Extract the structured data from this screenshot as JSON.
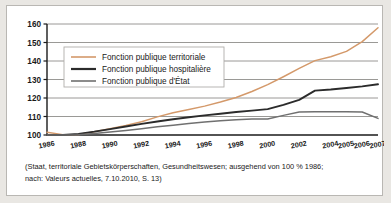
{
  "chart_data": {
    "type": "line",
    "title": "",
    "xlabel": "",
    "ylabel": "",
    "ylim": [
      100,
      160
    ],
    "yticks": [
      100,
      110,
      120,
      130,
      140,
      150,
      160
    ],
    "grid": true,
    "legend_position": "upper-left-inside",
    "x": [
      1986,
      1987,
      1988,
      1989,
      1990,
      1991,
      1992,
      1993,
      1994,
      1995,
      1996,
      1997,
      1998,
      1999,
      2000,
      2001,
      2002,
      2003,
      2004,
      2005,
      2006,
      2007
    ],
    "xticks": [
      1986,
      1988,
      1990,
      1992,
      1994,
      1996,
      1998,
      2000,
      2002,
      2004,
      2005,
      2006,
      2007
    ],
    "xtick_labels": [
      "1986",
      "1988",
      "1990",
      "1992",
      "1994",
      "1996",
      "1998",
      "2000",
      "2002",
      "2004",
      "2005",
      "2006",
      "2007"
    ],
    "series": [
      {
        "name": "Fonction publique territoriale",
        "color": "#d4996a",
        "values": [
          101.5,
          100.2,
          100.3,
          101.8,
          103.4,
          105.2,
          107.2,
          109.8,
          112.0,
          113.8,
          115.6,
          117.8,
          120.3,
          123.5,
          127.2,
          131.5,
          136.0,
          140.2,
          142.3,
          145.2,
          150.5,
          158.0
        ]
      },
      {
        "name": "Fonction publique hospitalière",
        "color": "#2b2b2b",
        "values": [
          100.0,
          100.0,
          100.6,
          101.8,
          103.2,
          104.6,
          106.0,
          107.3,
          108.5,
          109.6,
          110.6,
          111.5,
          112.4,
          113.2,
          114.0,
          116.3,
          119.0,
          124.0,
          124.6,
          125.4,
          126.3,
          127.4
        ]
      },
      {
        "name": "Fonction publique d'État",
        "color": "#707070",
        "values": [
          100.0,
          100.0,
          100.2,
          100.8,
          101.6,
          102.5,
          103.4,
          104.4,
          105.3,
          106.2,
          107.0,
          107.7,
          108.3,
          108.6,
          108.6,
          110.6,
          112.4,
          112.6,
          112.6,
          112.6,
          112.4,
          109.0
        ]
      }
    ],
    "caption": [
      "(Staat, territoriale Gebietskörperschaften, Gesundheitswesen; ausgehend von 100 % 1986;",
      "nach: Valeurs actuelles, 7.10.2010, S. 13)"
    ]
  },
  "colors": {
    "page_background": "#e9e7e3",
    "panel_background": "#ffffff",
    "panel_border": "#b9b7b3",
    "grid": "#8f8d8a",
    "axis": "#1a1a1a",
    "legend_border": "#b0aeaa",
    "text": "#1a1a1a"
  }
}
